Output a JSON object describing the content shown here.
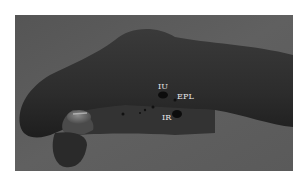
{
  "figure": {
    "labels": [
      {
        "id": "iu",
        "text": "IU",
        "x": 158,
        "y": 83
      },
      {
        "id": "epl",
        "text": "EPL",
        "x": 177,
        "y": 93
      },
      {
        "id": "ir",
        "text": "IR",
        "x": 162,
        "y": 114
      }
    ],
    "colors": {
      "background": "#5c5c5c",
      "hand": "#2e2e2e",
      "label": "#e6e6e6"
    }
  }
}
